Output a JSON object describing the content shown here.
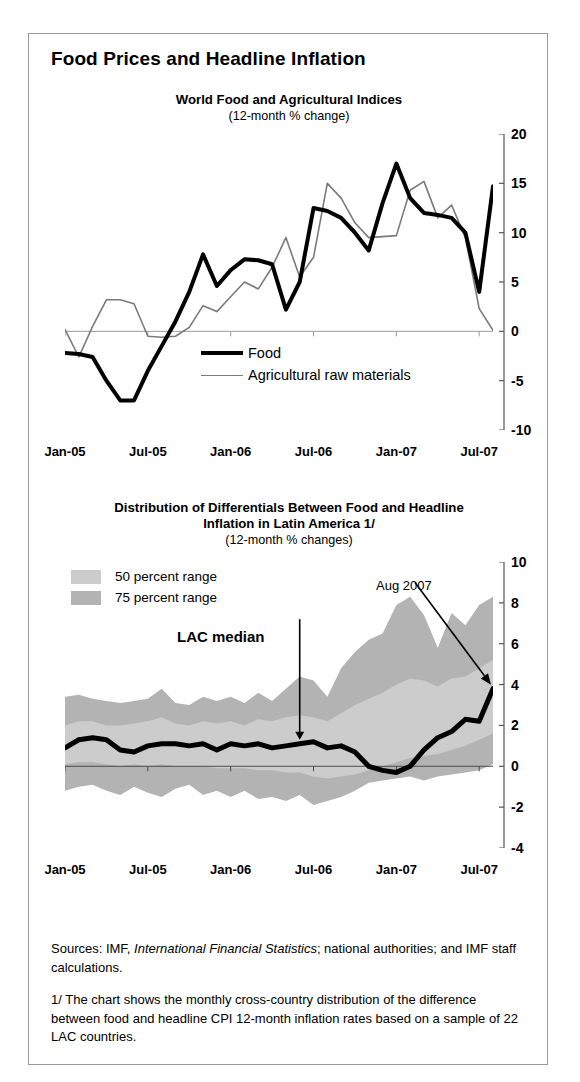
{
  "figure": {
    "title": "Food Prices and Headline Inflation"
  },
  "panels": [
    {
      "id": "world-food-agri",
      "title": "World Food and Agricultural Indices",
      "subtitle": "(12-month % change)",
      "legend": [
        {
          "key": "food",
          "label": "Food",
          "color": "#000000",
          "width": 4
        },
        {
          "key": "arm",
          "label": "Agricultural raw materials",
          "color": "#7a7a7a",
          "width": 1.6
        }
      ]
    },
    {
      "id": "lac-distribution",
      "title_line1": "Distribution of Differentials Between Food and Headline",
      "title_line2": "Inflation  in Latin America 1/",
      "subtitle": "(12-month % changes)",
      "legend": [
        {
          "key": "p50",
          "label": "50 percent range",
          "color": "#cccccc"
        },
        {
          "key": "p75",
          "label": "75 percent range",
          "color": "#b3b3b3"
        }
      ],
      "annotations": [
        {
          "key": "lac-median",
          "label": "LAC median"
        },
        {
          "key": "aug-2007",
          "label": "Aug 2007"
        }
      ]
    }
  ],
  "footnotes": {
    "sources_prefix": "Sources: IMF, ",
    "sources_italic": "International Financial Statistics",
    "sources_suffix": "; national authorities; and IMF staff calculations.",
    "note": "1/ The chart shows the monthly cross-country distribution of the difference between food and headline CPI 12-month inflation rates based  on a sample of 22 LAC countries."
  },
  "chart_data": [
    {
      "type": "line",
      "id": "world-food-agri",
      "title": "World Food and Agricultural Indices",
      "subtitle": "(12-month % change)",
      "xlabel": "",
      "ylabel": "",
      "ylim": [
        -10,
        20
      ],
      "yticks": [
        20,
        15,
        10,
        5,
        0,
        -5,
        -10
      ],
      "grid": false,
      "legend_position": "inside-bottom-center",
      "x": [
        "Jan-05",
        "Feb-05",
        "Mar-05",
        "Apr-05",
        "May-05",
        "Jun-05",
        "Jul-05",
        "Aug-05",
        "Sep-05",
        "Oct-05",
        "Nov-05",
        "Dec-05",
        "Jan-06",
        "Feb-06",
        "Mar-06",
        "Apr-06",
        "May-06",
        "Jun-06",
        "Jul-06",
        "Aug-06",
        "Sep-06",
        "Oct-06",
        "Nov-06",
        "Dec-06",
        "Jan-07",
        "Feb-07",
        "Mar-07",
        "Apr-07",
        "May-07",
        "Jun-07",
        "Jul-07",
        "Aug-07"
      ],
      "xticks": [
        "Jan-05",
        "Jul-05",
        "Jan-06",
        "Jul-06",
        "Jan-07",
        "Jul-07"
      ],
      "series": [
        {
          "name": "Food",
          "color": "#000000",
          "width": 4,
          "values": [
            -2.2,
            -2.3,
            -2.6,
            -5.0,
            -7.0,
            -7.0,
            -4.0,
            -1.5,
            1.0,
            4.0,
            7.8,
            4.6,
            6.2,
            7.3,
            7.2,
            6.8,
            2.2,
            5.0,
            12.5,
            12.2,
            11.5,
            10.0,
            8.2,
            13.0,
            17.0,
            13.5,
            12.0,
            11.8,
            11.5,
            10.0,
            4.0,
            14.7
          ]
        },
        {
          "name": "Agricultural raw materials",
          "color": "#7a7a7a",
          "width": 1.6,
          "values": [
            0.2,
            -2.6,
            0.5,
            3.2,
            3.2,
            2.8,
            -0.5,
            -0.6,
            -0.5,
            0.4,
            2.6,
            2.0,
            3.5,
            5.0,
            4.3,
            6.5,
            9.5,
            5.5,
            7.5,
            15.0,
            13.5,
            11.0,
            9.5,
            9.6,
            9.7,
            14.3,
            15.2,
            11.5,
            12.8,
            9.5,
            2.3,
            0.1
          ]
        }
      ]
    },
    {
      "type": "area",
      "id": "lac-distribution",
      "title": "Distribution of Differentials Between Food and Headline Inflation  in Latin America 1/",
      "subtitle": "(12-month % changes)",
      "xlabel": "",
      "ylabel": "",
      "ylim": [
        -4,
        10
      ],
      "yticks": [
        10,
        8,
        6,
        4,
        2,
        0,
        -2,
        -4
      ],
      "grid": false,
      "legend_position": "inside-top-left",
      "x": [
        "Jan-05",
        "Feb-05",
        "Mar-05",
        "Apr-05",
        "May-05",
        "Jun-05",
        "Jul-05",
        "Aug-05",
        "Sep-05",
        "Oct-05",
        "Nov-05",
        "Dec-05",
        "Jan-06",
        "Feb-06",
        "Mar-06",
        "Apr-06",
        "May-06",
        "Jun-06",
        "Jul-06",
        "Aug-06",
        "Sep-06",
        "Oct-06",
        "Nov-06",
        "Dec-06",
        "Jan-07",
        "Feb-07",
        "Mar-07",
        "Apr-07",
        "May-07",
        "Jun-07",
        "Jul-07",
        "Aug-07"
      ],
      "xticks": [
        "Jan-05",
        "Jul-05",
        "Jan-06",
        "Jul-06",
        "Jan-07",
        "Jul-07"
      ],
      "bands": [
        {
          "name": "75 percent range",
          "color": "#b3b3b3",
          "upper": [
            3.4,
            3.5,
            3.3,
            3.2,
            3.1,
            3.2,
            3.3,
            3.8,
            3.1,
            3.0,
            3.4,
            3.2,
            3.4,
            3.1,
            3.6,
            3.2,
            3.8,
            4.4,
            4.2,
            3.4,
            4.8,
            5.6,
            6.2,
            6.5,
            7.9,
            8.3,
            7.4,
            5.8,
            7.5,
            6.9,
            7.9,
            8.3
          ],
          "lower": [
            -1.2,
            -1.0,
            -0.9,
            -1.2,
            -1.4,
            -1.0,
            -1.3,
            -1.5,
            -1.1,
            -0.9,
            -1.4,
            -1.2,
            -1.5,
            -1.2,
            -1.6,
            -1.5,
            -1.7,
            -1.4,
            -1.9,
            -1.7,
            -1.5,
            -1.2,
            -0.8,
            -0.7,
            -0.6,
            -0.5,
            -0.7,
            -0.5,
            -0.4,
            -0.3,
            -0.2,
            0.1
          ]
        },
        {
          "name": "50 percent range",
          "color": "#cccccc",
          "upper": [
            2.0,
            2.2,
            2.2,
            2.0,
            2.0,
            2.1,
            2.2,
            2.4,
            2.1,
            2.0,
            2.2,
            2.1,
            2.2,
            2.0,
            2.3,
            2.2,
            2.4,
            2.5,
            2.4,
            2.2,
            2.6,
            3.0,
            3.3,
            3.6,
            4.0,
            4.3,
            4.2,
            3.9,
            4.3,
            4.4,
            4.8,
            5.2
          ],
          "lower": [
            0.1,
            0.2,
            0.2,
            0.1,
            0.0,
            0.1,
            0.0,
            0.1,
            0.0,
            0.0,
            0.0,
            -0.1,
            -0.1,
            -0.1,
            -0.2,
            -0.2,
            -0.3,
            -0.3,
            -0.5,
            -0.6,
            -0.5,
            -0.4,
            -0.2,
            0.0,
            0.2,
            0.4,
            0.5,
            0.6,
            0.8,
            1.0,
            1.3,
            1.6
          ]
        }
      ],
      "series": [
        {
          "name": "LAC median",
          "color": "#000000",
          "width": 5,
          "values": [
            0.9,
            1.3,
            1.4,
            1.3,
            0.8,
            0.7,
            1.0,
            1.1,
            1.1,
            1.0,
            1.1,
            0.8,
            1.1,
            1.0,
            1.1,
            0.9,
            1.0,
            1.1,
            1.2,
            0.9,
            1.0,
            0.7,
            0.0,
            -0.2,
            -0.3,
            0.0,
            0.8,
            1.4,
            1.7,
            2.3,
            2.2,
            3.8
          ]
        }
      ]
    }
  ]
}
